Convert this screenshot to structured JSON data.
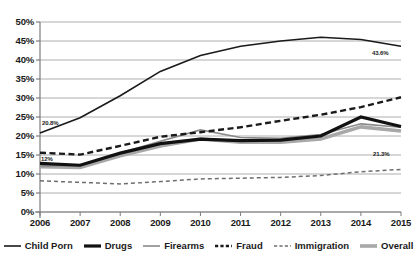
{
  "chart_data": {
    "type": "line",
    "title": "",
    "xlabel": "",
    "ylabel": "",
    "x": [
      2006,
      2007,
      2008,
      2009,
      2010,
      2011,
      2012,
      2013,
      2014,
      2015
    ],
    "xtick_labels": [
      "2006",
      "2007",
      "2008",
      "2009",
      "2010",
      "2011",
      "2012",
      "2013",
      "2014",
      "2015"
    ],
    "ytick_labels": [
      "50%",
      "45%",
      "40%",
      "35%",
      "30%",
      "25%",
      "20%",
      "15%",
      "10%",
      "5%",
      "0%"
    ],
    "ytick_values": [
      50,
      45,
      40,
      35,
      30,
      25,
      20,
      15,
      10,
      5,
      0
    ],
    "ylim": [
      0,
      50
    ],
    "grid": true,
    "legend_position": "bottom",
    "series": [
      {
        "name": "Child Porn",
        "style": "solid-thin-black",
        "color": "#1a1a1a",
        "values": [
          20.8,
          24.8,
          30.6,
          37.0,
          41.2,
          43.6,
          45.0,
          46.0,
          45.4,
          43.6
        ]
      },
      {
        "name": "Drugs",
        "style": "solid-thick-black",
        "color": "#111111",
        "values": [
          12.8,
          12.3,
          15.5,
          18.0,
          19.2,
          18.8,
          18.9,
          20.0,
          25.0,
          22.5
        ]
      },
      {
        "name": "Firearms",
        "style": "solid-thin-gray",
        "color": "#8a8a8a",
        "values": [
          12.1,
          12.2,
          15.5,
          18.6,
          21.6,
          19.6,
          19.4,
          20.4,
          23.2,
          22.3
        ]
      },
      {
        "name": "Fraud",
        "style": "dashed-thick-black",
        "color": "#1a1a1a",
        "values": [
          15.6,
          15.1,
          17.4,
          19.8,
          21.0,
          22.3,
          24.0,
          25.6,
          27.6,
          30.2
        ]
      },
      {
        "name": "Immigration",
        "style": "dashed-thin-gray",
        "color": "#6e6e6e",
        "values": [
          8.2,
          7.8,
          7.4,
          8.0,
          8.7,
          8.9,
          9.1,
          9.6,
          10.6,
          11.2
        ]
      },
      {
        "name": "Overall",
        "style": "solid-thick-gray",
        "color": "#a8a8a8",
        "values": [
          11.9,
          11.7,
          14.8,
          17.4,
          19.2,
          18.4,
          18.4,
          19.2,
          22.4,
          21.3
        ]
      }
    ],
    "annotations": [
      {
        "text": "20.8%",
        "x": 2006,
        "y": 20.8,
        "series": "Child Porn"
      },
      {
        "text": "12%",
        "x": 2006,
        "y": 11.9,
        "series": "Overall"
      },
      {
        "text": "43.6%",
        "x": 2015,
        "y": 43.6,
        "series": "Child Porn"
      },
      {
        "text": "21.3%",
        "x": 2015,
        "y": 21.3,
        "series": "Overall"
      }
    ]
  },
  "legend": {
    "items": [
      {
        "label": "Child Porn"
      },
      {
        "label": "Drugs"
      },
      {
        "label": "Firearms"
      },
      {
        "label": "Fraud"
      },
      {
        "label": "Immigration"
      },
      {
        "label": "Overall"
      }
    ]
  },
  "colors": {
    "axis": "#7d7d7d",
    "grid": "#9a9a9a",
    "text": "#1a1a1a",
    "black_line": "#1a1a1a",
    "gray_line": "#a8a8a8",
    "mid_gray_line": "#8a8a8a",
    "background": "#ffffff"
  }
}
